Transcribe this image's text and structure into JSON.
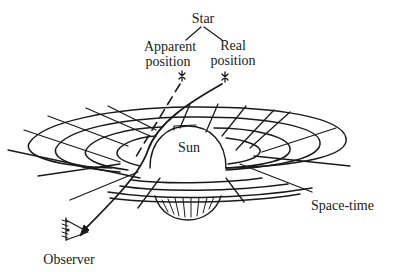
{
  "diagram": {
    "type": "gravitational-lensing",
    "labels": {
      "star": "Star",
      "apparent_position_line1": "Apparent",
      "apparent_position_line2": "position",
      "real_position_line1": "Real",
      "real_position_line2": "position",
      "sun": "Sun",
      "space_time": "Space-time",
      "observer": "Observer"
    },
    "elements": [
      {
        "id": "star-apparent",
        "icon": "star-icon",
        "label": "Apparent position"
      },
      {
        "id": "star-real",
        "icon": "star-icon",
        "label": "Real position"
      },
      {
        "id": "sun",
        "shape": "sphere",
        "label": "Sun"
      },
      {
        "id": "space-time-grid",
        "shape": "curved-grid",
        "label": "Space-time"
      },
      {
        "id": "observer",
        "icon": "eye-icon",
        "label": "Observer"
      }
    ],
    "edges": [
      {
        "from": "star-real",
        "to": "observer",
        "style": "solid-arrow",
        "meaning": "actual light path bent by Sun"
      },
      {
        "from": "star-apparent",
        "to": "observer",
        "style": "dashed",
        "meaning": "apparent straight-line direction"
      }
    ],
    "colors": {
      "ink": "#1a1a1a",
      "background": "#ffffff"
    }
  }
}
